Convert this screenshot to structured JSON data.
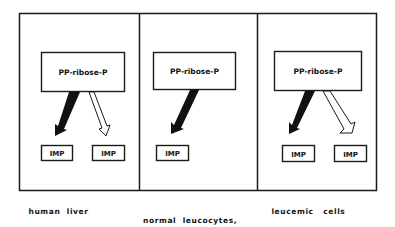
{
  "diagram": {
    "panels": [
      {
        "id": "human-liver",
        "source_label": "PP-ribose-P",
        "caption": [
          "human  liver"
        ],
        "targets": [
          {
            "label": "IMP",
            "arrow": "filled"
          },
          {
            "label": "IMP",
            "arrow": "hollow"
          }
        ]
      },
      {
        "id": "normal-leucocytes",
        "source_label": "PP-ribose-P",
        "caption": [
          "normal  leucocytes,",
          "bone  marrow"
        ],
        "targets": [
          {
            "label": "IMP",
            "arrow": "filled"
          }
        ]
      },
      {
        "id": "leucemic-cells",
        "source_label": "PP-ribose-P",
        "caption": [
          "leucemic   cells"
        ],
        "targets": [
          {
            "label": "IMP",
            "arrow": "filled"
          },
          {
            "label": "IMP",
            "arrow": "hollow"
          }
        ]
      }
    ],
    "colors": {
      "stroke": "#1a1a1a",
      "fill_dark": "#111111",
      "background": "#ffffff"
    }
  }
}
